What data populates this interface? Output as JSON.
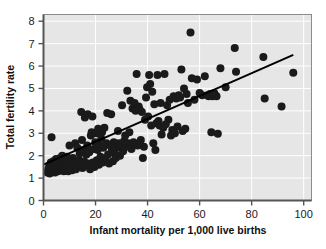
{
  "chart_data": {
    "type": "scatter",
    "title": "",
    "xlabel": "Infant mortality per 1,000 live births",
    "ylabel": "Total fertility rate",
    "xlim": [
      0,
      103
    ],
    "ylim": [
      0,
      8.3
    ],
    "xticks": [
      0,
      20,
      40,
      60,
      80,
      100
    ],
    "yticks": [
      0,
      1,
      2,
      3,
      4,
      5,
      6,
      7,
      8
    ],
    "xtick_labels": [
      "0",
      "20",
      "40",
      "60",
      "80",
      "100"
    ],
    "ytick_labels": [
      "0",
      "1",
      "2",
      "3",
      "4",
      "5",
      "6",
      "7",
      "8"
    ],
    "grid": true,
    "grid_color": "#ffffff",
    "plot_background": "#e6e6e6",
    "legend": null,
    "marker_color": "#1a1a1a",
    "marker_size": 5.2,
    "trendline": {
      "type": "line",
      "color": "#000000",
      "x": [
        0,
        96
      ],
      "y": [
        1.6,
        6.5
      ]
    },
    "points": [
      [
        1.5,
        1.25
      ],
      [
        1.8,
        1.4
      ],
      [
        2.0,
        1.3
      ],
      [
        2.2,
        1.55
      ],
      [
        2.4,
        1.2
      ],
      [
        2.6,
        1.45
      ],
      [
        2.8,
        1.7
      ],
      [
        3.0,
        1.35
      ],
      [
        3.1,
        2.82
      ],
      [
        3.2,
        1.6
      ],
      [
        3.4,
        1.5
      ],
      [
        3.6,
        1.3
      ],
      [
        3.8,
        1.75
      ],
      [
        4.0,
        1.4
      ],
      [
        4.2,
        1.6
      ],
      [
        4.4,
        1.25
      ],
      [
        4.6,
        1.5
      ],
      [
        4.8,
        1.85
      ],
      [
        5.0,
        1.35
      ],
      [
        5.2,
        1.65
      ],
      [
        5.4,
        1.45
      ],
      [
        5.6,
        1.3
      ],
      [
        5.8,
        1.7
      ],
      [
        6.0,
        1.55
      ],
      [
        6.2,
        1.4
      ],
      [
        6.4,
        1.9
      ],
      [
        6.6,
        1.6
      ],
      [
        6.8,
        1.35
      ],
      [
        7.0,
        1.5
      ],
      [
        7.2,
        2.0
      ],
      [
        7.4,
        1.7
      ],
      [
        7.6,
        1.45
      ],
      [
        7.8,
        1.3
      ],
      [
        8.0,
        1.6
      ],
      [
        8.2,
        1.8
      ],
      [
        8.5,
        1.5
      ],
      [
        8.8,
        1.4
      ],
      [
        9.0,
        1.95
      ],
      [
        9.2,
        1.65
      ],
      [
        9.5,
        1.3
      ],
      [
        9.8,
        1.55
      ],
      [
        10.0,
        2.45
      ],
      [
        10.2,
        1.75
      ],
      [
        10.5,
        1.45
      ],
      [
        10.8,
        1.6
      ],
      [
        11.0,
        1.35
      ],
      [
        11.3,
        1.9
      ],
      [
        11.6,
        1.55
      ],
      [
        11.9,
        1.7
      ],
      [
        12.2,
        2.55
      ],
      [
        12.5,
        1.4
      ],
      [
        12.8,
        1.65
      ],
      [
        13.0,
        2.35
      ],
      [
        13.3,
        1.5
      ],
      [
        13.6,
        1.8
      ],
      [
        13.9,
        2.1
      ],
      [
        14.2,
        1.6
      ],
      [
        14.5,
        3.95
      ],
      [
        14.8,
        2.7
      ],
      [
        15.0,
        1.45
      ],
      [
        15.3,
        2.25
      ],
      [
        15.6,
        1.75
      ],
      [
        15.9,
        3.7
      ],
      [
        16.2,
        1.55
      ],
      [
        16.5,
        2.05
      ],
      [
        16.8,
        2.45
      ],
      [
        17.0,
        3.85
      ],
      [
        17.3,
        1.65
      ],
      [
        17.6,
        2.15
      ],
      [
        17.9,
        1.4
      ],
      [
        18.2,
        2.9
      ],
      [
        18.5,
        3.05
      ],
      [
        18.8,
        3.75
      ],
      [
        19.0,
        1.7
      ],
      [
        19.3,
        2.3
      ],
      [
        19.6,
        1.5
      ],
      [
        19.9,
        2.6
      ],
      [
        20.2,
        3.0
      ],
      [
        20.5,
        1.8
      ],
      [
        20.8,
        2.25
      ],
      [
        21.0,
        3.2
      ],
      [
        21.3,
        1.6
      ],
      [
        21.6,
        2.45
      ],
      [
        21.9,
        1.95
      ],
      [
        22.2,
        2.75
      ],
      [
        22.5,
        3.05
      ],
      [
        22.8,
        1.7
      ],
      [
        23.0,
        2.35
      ],
      [
        23.4,
        3.25
      ],
      [
        23.8,
        1.85
      ],
      [
        24.2,
        2.55
      ],
      [
        24.5,
        3.9
      ],
      [
        24.8,
        2.05
      ],
      [
        25.2,
        1.65
      ],
      [
        25.6,
        2.45
      ],
      [
        26.0,
        3.85
      ],
      [
        26.3,
        2.25
      ],
      [
        26.7,
        1.75
      ],
      [
        27.0,
        2.6
      ],
      [
        27.4,
        2.1
      ],
      [
        27.8,
        1.9
      ],
      [
        28.2,
        2.35
      ],
      [
        28.6,
        3.1
      ],
      [
        29.0,
        2.55
      ],
      [
        29.4,
        2.0
      ],
      [
        29.8,
        2.45
      ],
      [
        30.2,
        4.25
      ],
      [
        30.6,
        2.2
      ],
      [
        31.0,
        2.65
      ],
      [
        31.4,
        2.9
      ],
      [
        31.8,
        2.4
      ],
      [
        32.2,
        4.9
      ],
      [
        32.6,
        2.55
      ],
      [
        33.0,
        3.05
      ],
      [
        33.4,
        4.45
      ],
      [
        33.8,
        2.3
      ],
      [
        34.2,
        4.1
      ],
      [
        34.6,
        2.6
      ],
      [
        35.0,
        4.35
      ],
      [
        35.4,
        4.0
      ],
      [
        35.8,
        5.65
      ],
      [
        36.2,
        2.45
      ],
      [
        36.6,
        4.2
      ],
      [
        37.0,
        4.05
      ],
      [
        37.4,
        2.7
      ],
      [
        37.8,
        3.95
      ],
      [
        38.2,
        1.9
      ],
      [
        38.6,
        2.4
      ],
      [
        39.0,
        3.6
      ],
      [
        39.4,
        4.6
      ],
      [
        39.8,
        5.05
      ],
      [
        40.2,
        3.75
      ],
      [
        40.6,
        5.6
      ],
      [
        41.0,
        5.2
      ],
      [
        41.4,
        3.35
      ],
      [
        41.8,
        4.85
      ],
      [
        42.2,
        2.55
      ],
      [
        42.6,
        4.3
      ],
      [
        43.0,
        2.25
      ],
      [
        43.4,
        3.45
      ],
      [
        43.8,
        5.6
      ],
      [
        44.2,
        3.55
      ],
      [
        44.6,
        3.35
      ],
      [
        45.0,
        4.35
      ],
      [
        45.4,
        2.95
      ],
      [
        46.0,
        3.25
      ],
      [
        46.5,
        5.65
      ],
      [
        47.0,
        3.4
      ],
      [
        47.5,
        4.25
      ],
      [
        48.0,
        3.6
      ],
      [
        48.5,
        4.5
      ],
      [
        49.0,
        2.9
      ],
      [
        49.5,
        3.15
      ],
      [
        50.0,
        4.65
      ],
      [
        50.5,
        3.0
      ],
      [
        51.0,
        4.55
      ],
      [
        51.5,
        3.3
      ],
      [
        52.0,
        4.7
      ],
      [
        52.5,
        4.6
      ],
      [
        53.0,
        5.85
      ],
      [
        53.5,
        3.1
      ],
      [
        54.0,
        5.0
      ],
      [
        54.5,
        3.2
      ],
      [
        55.0,
        4.75
      ],
      [
        55.5,
        4.35
      ],
      [
        56.5,
        7.5
      ],
      [
        57.0,
        5.45
      ],
      [
        58.0,
        4.5
      ],
      [
        59.0,
        5.4
      ],
      [
        60.0,
        4.8
      ],
      [
        61.0,
        4.7
      ],
      [
        62.0,
        5.55
      ],
      [
        63.0,
        4.7
      ],
      [
        63.5,
        4.65
      ],
      [
        64.0,
        4.75
      ],
      [
        64.5,
        4.7
      ],
      [
        65.0,
        4.65
      ],
      [
        65.3,
        4.7
      ],
      [
        65.6,
        4.8
      ],
      [
        66.0,
        4.7
      ],
      [
        66.5,
        4.65
      ],
      [
        64.5,
        3.05
      ],
      [
        67.0,
        2.98
      ],
      [
        68.0,
        5.9
      ],
      [
        70.0,
        5.05
      ],
      [
        73.5,
        6.8
      ],
      [
        74.0,
        5.75
      ],
      [
        84.5,
        6.4
      ],
      [
        85.0,
        4.55
      ],
      [
        91.5,
        4.2
      ],
      [
        96.0,
        5.7
      ]
    ]
  },
  "axes": {
    "x_title": "Infant mortality per 1,000 live births",
    "y_title": "Total fertility rate"
  }
}
